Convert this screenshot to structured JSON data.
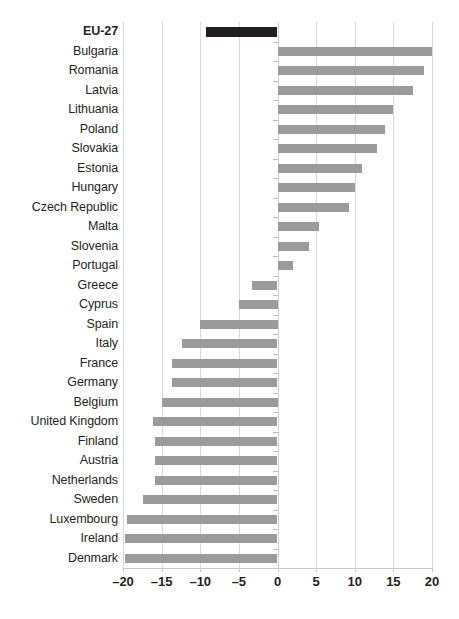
{
  "chart_data": {
    "type": "bar",
    "orientation": "horizontal",
    "title": "",
    "subtitle": "",
    "xlabel": "",
    "ylabel": "",
    "xlim": [
      -20,
      20
    ],
    "xticks": [
      -20,
      -15,
      -10,
      -5,
      0,
      5,
      10,
      15,
      20
    ],
    "xtick_labels": [
      "–20",
      "–15",
      "–10",
      "–5",
      "0",
      "5",
      "10",
      "15",
      "20"
    ],
    "grid": true,
    "legend": null,
    "categories": [
      "EU-27",
      "Bulgaria",
      "Romania",
      "Latvia",
      "Lithuania",
      "Poland",
      "Slovakia",
      "Estonia",
      "Hungary",
      "Czech Republic",
      "Malta",
      "Slovenia",
      "Portugal",
      "Greece",
      "Cyprus",
      "Spain",
      "Italy",
      "France",
      "Germany",
      "Belgium",
      "United Kingdom",
      "Finland",
      "Austria",
      "Netherlands",
      "Sweden",
      "Luxembourg",
      "Ireland",
      "Denmark"
    ],
    "values": [
      -9.3,
      20.0,
      19.0,
      17.6,
      15.0,
      13.9,
      12.9,
      11.0,
      10.0,
      9.3,
      5.4,
      4.1,
      2.0,
      -3.3,
      -5.0,
      -10.0,
      -12.4,
      -13.7,
      -13.6,
      -15.0,
      -16.1,
      -15.9,
      -15.9,
      -15.8,
      -17.4,
      -19.5,
      -19.7,
      -19.7
    ],
    "highlight_index": 0,
    "colors": {
      "bar": "#9b9b9b",
      "highlight_bar": "#231f20",
      "grid": "#d9d9d9",
      "text": "#231f20",
      "background": "#ffffff"
    }
  }
}
